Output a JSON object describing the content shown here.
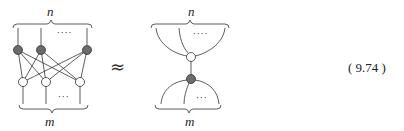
{
  "left_diagram": {
    "top_label": "n",
    "bottom_label": "m",
    "top_dots": "····",
    "bottom_dots": "···",
    "gray_nodes": [
      {
        "x": 18,
        "y": 50
      },
      {
        "x": 41,
        "y": 50
      },
      {
        "x": 87,
        "y": 50
      }
    ],
    "white_nodes": [
      {
        "x": 23,
        "y": 82
      },
      {
        "x": 46,
        "y": 82
      },
      {
        "x": 80,
        "y": 82
      }
    ]
  },
  "relation_symbol": "≈",
  "right_diagram": {
    "top_label": "n",
    "bottom_label": "m",
    "top_dots": "····",
    "bottom_dots": "···",
    "white_node": {
      "x": 191,
      "y": 57
    },
    "gray_node": {
      "x": 191,
      "y": 79
    }
  },
  "equation_number": "( 9.74 )",
  "colors": {
    "gray_node": "#6b6b6b",
    "white_node": "#ffffff",
    "stroke": "#333333"
  }
}
